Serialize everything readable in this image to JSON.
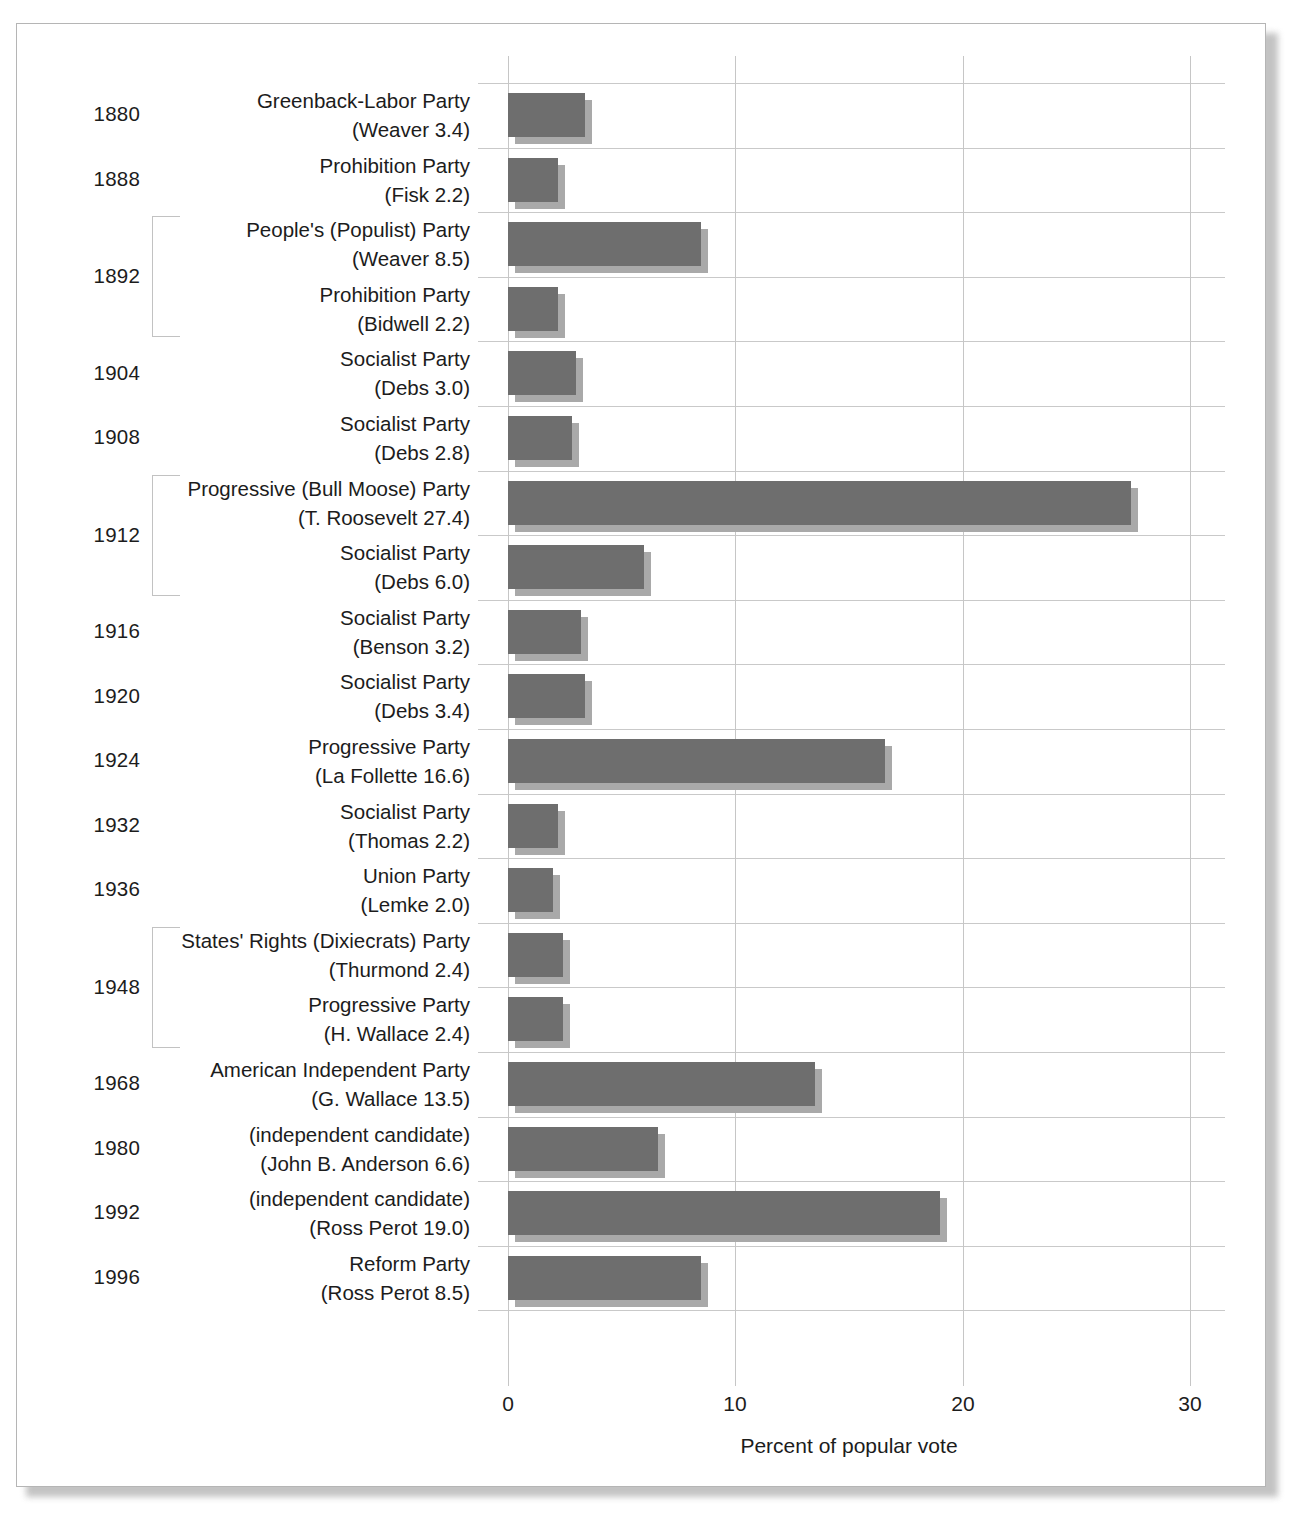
{
  "chart_data": {
    "type": "bar",
    "orientation": "horizontal",
    "title": "",
    "xlabel": "Percent of popular vote",
    "ylabel": "",
    "xlim": [
      0,
      30
    ],
    "xticks": [
      0,
      10,
      20,
      30
    ],
    "xtick_labels": [
      "0",
      "10",
      "20",
      "30"
    ],
    "grid": true,
    "legend": "none",
    "bar_color": "#6e6e6e",
    "shadow_color": "#a9a9a9",
    "categories": [
      "Greenback-Labor Party (Weaver 3.4)",
      "Prohibition Party (Fisk 2.2)",
      "People's (Populist) Party (Weaver 8.5)",
      "Prohibition Party (Bidwell 2.2)",
      "Socialist Party (Debs 3.0)",
      "Socialist Party (Debs 2.8)",
      "Progressive (Bull Moose) Party (T. Roosevelt 27.4)",
      "Socialist Party (Debs 6.0)",
      "Socialist Party (Benson 3.2)",
      "Socialist Party (Debs 3.4)",
      "Progressive Party (La Follette 16.6)",
      "Socialist Party (Thomas 2.2)",
      "Union Party (Lemke 2.0)",
      "States' Rights (Dixiecrats) Party (Thurmond 2.4)",
      "Progressive Party (H. Wallace 2.4)",
      "American Independent Party (G. Wallace 13.5)",
      "(independent candidate) (John B. Anderson 6.6)",
      "(independent candidate) (Ross Perot 19.0)",
      "Reform Party (Ross Perot 8.5)"
    ],
    "values": [
      3.4,
      2.2,
      8.5,
      2.2,
      3.0,
      2.8,
      27.4,
      6.0,
      3.2,
      3.4,
      16.6,
      2.2,
      2.0,
      2.4,
      2.4,
      13.5,
      6.6,
      19.0,
      8.5
    ]
  },
  "rows": [
    {
      "year": "1880",
      "party": "Greenback-Labor Party",
      "candidate": "(Weaver 3.4)",
      "value": 3.4,
      "grouped": false
    },
    {
      "year": "1888",
      "party": "Prohibition Party",
      "candidate": "(Fisk 2.2)",
      "value": 2.2,
      "grouped": false
    },
    {
      "year": "1892",
      "party": "People's (Populist) Party",
      "candidate": "(Weaver 8.5)",
      "value": 8.5,
      "grouped": true
    },
    {
      "year": "",
      "party": "Prohibition Party",
      "candidate": "(Bidwell 2.2)",
      "value": 2.2,
      "grouped": true
    },
    {
      "year": "1904",
      "party": "Socialist Party",
      "candidate": "(Debs 3.0)",
      "value": 3.0,
      "grouped": false
    },
    {
      "year": "1908",
      "party": "Socialist Party",
      "candidate": "(Debs 2.8)",
      "value": 2.8,
      "grouped": false
    },
    {
      "year": "1912",
      "party": "Progressive (Bull Moose) Party",
      "candidate": "(T. Roosevelt 27.4)",
      "value": 27.4,
      "grouped": true
    },
    {
      "year": "",
      "party": "Socialist Party",
      "candidate": "(Debs 6.0)",
      "value": 6.0,
      "grouped": true
    },
    {
      "year": "1916",
      "party": "Socialist Party",
      "candidate": "(Benson 3.2)",
      "value": 3.2,
      "grouped": false
    },
    {
      "year": "1920",
      "party": "Socialist Party",
      "candidate": "(Debs 3.4)",
      "value": 3.4,
      "grouped": false
    },
    {
      "year": "1924",
      "party": "Progressive Party",
      "candidate": "(La Follette 16.6)",
      "value": 16.6,
      "grouped": false
    },
    {
      "year": "1932",
      "party": "Socialist Party",
      "candidate": "(Thomas 2.2)",
      "value": 2.2,
      "grouped": false
    },
    {
      "year": "1936",
      "party": "Union Party",
      "candidate": "(Lemke 2.0)",
      "value": 2.0,
      "grouped": false
    },
    {
      "year": "1948",
      "party": "States' Rights (Dixiecrats) Party",
      "candidate": "(Thurmond 2.4)",
      "value": 2.4,
      "grouped": true
    },
    {
      "year": "",
      "party": "Progressive Party",
      "candidate": "(H. Wallace 2.4)",
      "value": 2.4,
      "grouped": true
    },
    {
      "year": "1968",
      "party": "American Independent Party",
      "candidate": "(G. Wallace 13.5)",
      "value": 13.5,
      "grouped": false
    },
    {
      "year": "1980",
      "party": "(independent candidate)",
      "candidate": "(John B. Anderson 6.6)",
      "value": 6.6,
      "grouped": false
    },
    {
      "year": "1992",
      "party": "(independent candidate)",
      "candidate": "(Ross Perot 19.0)",
      "value": 19.0,
      "grouped": false
    },
    {
      "year": "1996",
      "party": "Reform Party",
      "candidate": "(Ross Perot 8.5)",
      "value": 8.5,
      "grouped": false
    }
  ],
  "year_groups": [
    {
      "label": "1892",
      "start_row": 2,
      "span": 2
    },
    {
      "label": "1912",
      "start_row": 6,
      "span": 2
    },
    {
      "label": "1948",
      "start_row": 13,
      "span": 2
    }
  ],
  "axis": {
    "title": "Percent of popular vote",
    "ticks": [
      "0",
      "10",
      "20",
      "30"
    ]
  }
}
